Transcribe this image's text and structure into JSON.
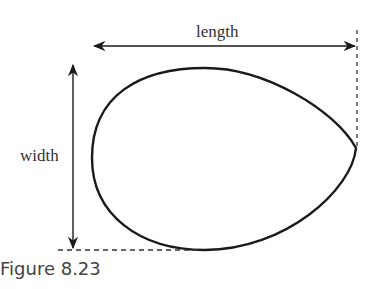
{
  "diagram": {
    "labels": {
      "length": "length",
      "width": "width"
    },
    "caption": "Figure 8.23",
    "colors": {
      "stroke": "#1a1a1a",
      "text": "#333333",
      "caption": "#444444"
    }
  }
}
